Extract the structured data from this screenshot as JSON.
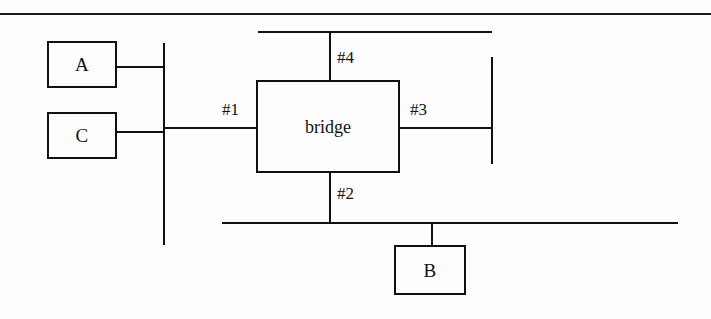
{
  "figure": {
    "width": 711,
    "height": 319,
    "background_color": "#fdfdfd",
    "stroke_color": "#111111"
  },
  "nodes": [
    {
      "id": "host-a",
      "label": "A",
      "x": 47,
      "y": 41,
      "width": 70,
      "height": 47
    },
    {
      "id": "host-c",
      "label": "C",
      "x": 47,
      "y": 112,
      "width": 70,
      "height": 47
    },
    {
      "id": "bridge",
      "label": "bridge",
      "x": 256,
      "y": 80,
      "width": 144,
      "height": 93
    },
    {
      "id": "host-b",
      "label": "B",
      "x": 394,
      "y": 245,
      "width": 72,
      "height": 50
    }
  ],
  "ports": [
    {
      "id": "port-1",
      "label": "#1",
      "x": 222,
      "y": 101
    },
    {
      "id": "port-2",
      "label": "#2",
      "x": 337,
      "y": 185
    },
    {
      "id": "port-3",
      "label": "#3",
      "x": 410,
      "y": 101
    },
    {
      "id": "port-4",
      "label": "#4",
      "x": 337,
      "y": 49
    }
  ],
  "buses": [
    {
      "id": "left-bus",
      "orientation": "vertical",
      "x": 163,
      "y": 43,
      "length": 202
    },
    {
      "id": "top-bus",
      "orientation": "horizontal",
      "x": 258,
      "y": 31,
      "length": 234
    },
    {
      "id": "right-bus",
      "orientation": "vertical",
      "x": 491,
      "y": 57,
      "length": 107
    },
    {
      "id": "bottom-bus",
      "orientation": "horizontal",
      "x": 222,
      "y": 222,
      "length": 456
    }
  ],
  "links": [
    {
      "id": "link-a-to-left-bus",
      "orientation": "horizontal",
      "x": 117,
      "y": 66,
      "length": 47
    },
    {
      "id": "link-c-to-left-bus",
      "orientation": "horizontal",
      "x": 117,
      "y": 131,
      "length": 47
    },
    {
      "id": "link-left-bus-to-port1",
      "orientation": "horizontal",
      "x": 163,
      "y": 127,
      "length": 94
    },
    {
      "id": "link-port3-to-right-bus",
      "orientation": "horizontal",
      "x": 400,
      "y": 127,
      "length": 92
    },
    {
      "id": "link-port4-to-top-bus",
      "orientation": "vertical",
      "x": 329,
      "y": 31,
      "length": 50
    },
    {
      "id": "link-port2-to-bottom-bus",
      "orientation": "vertical",
      "x": 329,
      "y": 173,
      "length": 50
    },
    {
      "id": "link-bottom-bus-to-b",
      "orientation": "vertical",
      "x": 431,
      "y": 222,
      "length": 24
    }
  ],
  "page_rule": {
    "id": "page-rule-top",
    "x": 0,
    "y": 13,
    "width": 711,
    "height": 2
  }
}
